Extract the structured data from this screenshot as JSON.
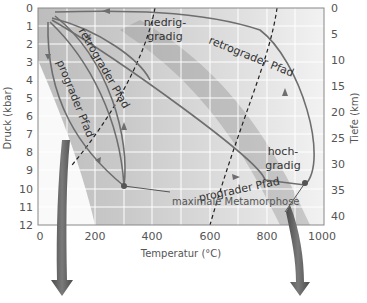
{
  "diagram": {
    "x_axis": {
      "label": "Temperatur (°C)",
      "ticks": [
        "0",
        "200",
        "400",
        "600",
        "800",
        "1000"
      ]
    },
    "y_axis_left": {
      "label": "Druck (kbar)",
      "ticks": [
        "0",
        "1",
        "2",
        "3",
        "4",
        "5",
        "6",
        "7",
        "8",
        "9",
        "10",
        "11",
        "12"
      ]
    },
    "y_axis_right": {
      "label": "Tiefe (km)",
      "ticks": [
        "0",
        "5",
        "10",
        "15",
        "20",
        "25",
        "30",
        "35",
        "40"
      ]
    },
    "labels": {
      "low_grade_1": "niedrig-",
      "low_grade_2": "gradig",
      "high_grade_1": "hoch-",
      "high_grade_2": "gradig",
      "retro_path_top": "retrograder Pfad",
      "retro_path_mid": "retrograder Pfad",
      "prograde_path_left": "prograder Pfad",
      "prograde_path_bottom": "prograder Pfad",
      "max_metamorphism": "maximale Metamorphose"
    },
    "colors": {
      "background_band": "#c8c8c8",
      "path_line": "#6e6e6e",
      "arrow": "#6a6a6a",
      "grid": "#ffffff"
    }
  }
}
